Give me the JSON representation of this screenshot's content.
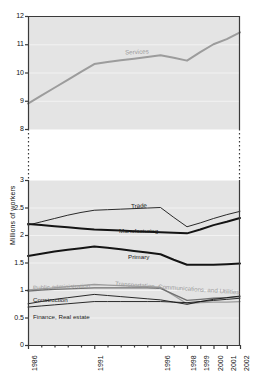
{
  "axis": {
    "ylabel": "Millions of workers",
    "upper_ticks": [
      "12",
      "11",
      "10",
      "9",
      "8"
    ],
    "lower_ticks": [
      "3",
      "2.5",
      "2",
      "1.5",
      "1",
      "0.5",
      "0"
    ],
    "xticks": [
      "1986",
      "1991",
      "1996",
      "1998",
      "1999",
      "2000",
      "2001",
      "2002"
    ]
  },
  "labels": {
    "services": "Services",
    "trade": "Trade",
    "manufacturing": "Manufacturing",
    "primary": "Primary",
    "public_administration": "Public administration",
    "transportation": "Transportation, Communications, and Utilities",
    "construction": "Construction",
    "finance": "Finance, Real estate"
  },
  "colors": {
    "plot_background": "#e4e4e4",
    "grid": "#f2f2f2",
    "axis": "#3a3a3a",
    "dark_series": "#141414",
    "gray_series": "#9c9c9c",
    "mid_series": "#6f6f6f"
  },
  "chart_data": {
    "type": "line",
    "title": "",
    "xlabel": "",
    "ylabel": "Millions of workers",
    "grid": true,
    "legend": "inline-labels",
    "broken_axis": {
      "lower_range": [
        0,
        3
      ],
      "upper_range": [
        8,
        12
      ],
      "note": "y-axis broken between 3 and 8"
    },
    "x": [
      1986,
      1987,
      1988,
      1989,
      1990,
      1991,
      1992,
      1993,
      1994,
      1995,
      1996,
      1997,
      1998,
      1999,
      2000,
      2001,
      2002
    ],
    "xtick_labels": [
      "1986",
      "1991",
      "1996",
      "1998",
      "1999",
      "2000",
      "2001",
      "2002"
    ],
    "series": [
      {
        "name": "Services",
        "color": "#9c9c9c",
        "width": "thick",
        "values": [
          8.9,
          9.18,
          9.46,
          9.74,
          10.02,
          10.3,
          10.37,
          10.43,
          10.49,
          10.55,
          10.61,
          10.52,
          10.42,
          10.72,
          11.0,
          11.18,
          11.42
        ]
      },
      {
        "name": "Trade",
        "color": "#141414",
        "width": "thin",
        "values": [
          2.18,
          2.24,
          2.3,
          2.36,
          2.41,
          2.45,
          2.46,
          2.47,
          2.48,
          2.49,
          2.5,
          2.32,
          2.15,
          2.22,
          2.3,
          2.37,
          2.43
        ]
      },
      {
        "name": "Manufacturing",
        "color": "#141414",
        "width": "thick",
        "values": [
          2.2,
          2.18,
          2.16,
          2.14,
          2.12,
          2.1,
          2.09,
          2.08,
          2.07,
          2.06,
          2.05,
          2.04,
          2.03,
          2.1,
          2.18,
          2.24,
          2.31
        ]
      },
      {
        "name": "Primary",
        "color": "#141414",
        "width": "thick",
        "values": [
          1.62,
          1.66,
          1.7,
          1.73,
          1.76,
          1.79,
          1.77,
          1.74,
          1.71,
          1.68,
          1.65,
          1.55,
          1.46,
          1.46,
          1.46,
          1.47,
          1.48
        ]
      },
      {
        "name": "Public administration",
        "color": "#9c9c9c",
        "width": "medium",
        "values": [
          1.0,
          1.02,
          1.04,
          1.06,
          1.08,
          1.1,
          1.09,
          1.08,
          1.07,
          1.06,
          1.05,
          0.9,
          0.75,
          0.77,
          0.78,
          0.78,
          0.79
        ]
      },
      {
        "name": "Transportation, Communications, and Utilities",
        "color": "#6f6f6f",
        "width": "medium",
        "values": [
          0.98,
          1.0,
          1.01,
          1.02,
          1.03,
          1.04,
          1.04,
          1.04,
          1.04,
          1.04,
          1.03,
          0.92,
          0.81,
          0.83,
          0.85,
          0.86,
          0.88
        ]
      },
      {
        "name": "Construction",
        "color": "#141414",
        "width": "thin",
        "values": [
          0.75,
          0.79,
          0.83,
          0.86,
          0.89,
          0.92,
          0.9,
          0.88,
          0.86,
          0.84,
          0.82,
          0.78,
          0.74,
          0.79,
          0.83,
          0.86,
          0.89
        ]
      },
      {
        "name": "Finance, Real estate",
        "color": "#141414",
        "width": "thin",
        "values": [
          0.69,
          0.71,
          0.73,
          0.75,
          0.77,
          0.79,
          0.79,
          0.79,
          0.79,
          0.79,
          0.79,
          0.78,
          0.77,
          0.79,
          0.81,
          0.83,
          0.85
        ]
      }
    ]
  }
}
